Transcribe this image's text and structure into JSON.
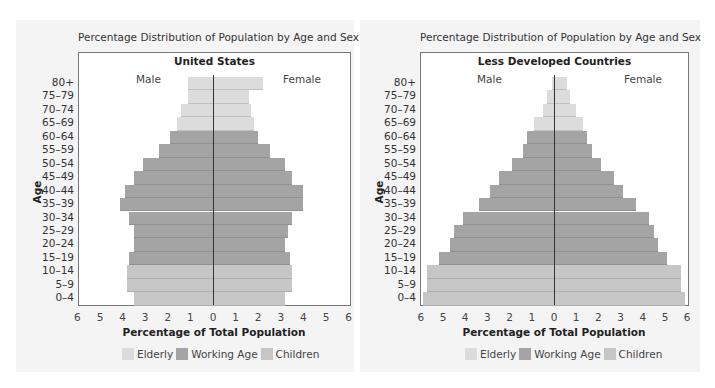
{
  "colors": {
    "elderly": "#dcdcdc",
    "working": "#a4a4a4",
    "children": "#c6c6c6",
    "panel": "#f4f4f4"
  },
  "chart_data": [
    {
      "type": "bar",
      "orientation": "horizontal-population-pyramid",
      "title": "Percentage Distribution of Population by Age and Sex",
      "subtitle": "United States",
      "xlabel": "Percentage of Total Population",
      "ylabel": "Age",
      "left_label": "Male",
      "right_label": "Female",
      "xlim": [
        -6,
        6
      ],
      "x_ticks": [
        "6",
        "5",
        "4",
        "3",
        "2",
        "1",
        "0",
        "1",
        "2",
        "3",
        "4",
        "5",
        "6"
      ],
      "categories": [
        "80+",
        "75–79",
        "70–74",
        "65–69",
        "60–64",
        "55–59",
        "50–54",
        "45–49",
        "40–44",
        "35–39",
        "30–34",
        "25–29",
        "20–24",
        "15–19",
        "10–14",
        "5–9",
        "0–4"
      ],
      "groups": [
        "Elderly",
        "Elderly",
        "Elderly",
        "Elderly",
        "Working Age",
        "Working Age",
        "Working Age",
        "Working Age",
        "Working Age",
        "Working Age",
        "Working Age",
        "Working Age",
        "Working Age",
        "Working Age",
        "Children",
        "Children",
        "Children"
      ],
      "series": [
        {
          "name": "Male",
          "values": [
            1.1,
            1.1,
            1.4,
            1.6,
            1.9,
            2.4,
            3.1,
            3.5,
            3.9,
            4.1,
            3.7,
            3.5,
            3.5,
            3.7,
            3.8,
            3.8,
            3.5
          ]
        },
        {
          "name": "Female",
          "values": [
            2.2,
            1.6,
            1.7,
            1.8,
            2.0,
            2.5,
            3.2,
            3.5,
            4.0,
            4.0,
            3.5,
            3.3,
            3.2,
            3.4,
            3.5,
            3.5,
            3.2
          ]
        }
      ],
      "legend": [
        "Elderly",
        "Working Age",
        "Children"
      ],
      "legend_position": "bottom",
      "grid": false
    },
    {
      "type": "bar",
      "orientation": "horizontal-population-pyramid",
      "title": "Percentage Distribution of Population by Age and Sex",
      "subtitle": "Less Developed Countries",
      "xlabel": "Percentage of Total Population",
      "ylabel": "Age",
      "left_label": "Male",
      "right_label": "Female",
      "xlim": [
        -6,
        6
      ],
      "x_ticks": [
        "6",
        "5",
        "4",
        "3",
        "2",
        "1",
        "0",
        "1",
        "2",
        "3",
        "4",
        "5",
        "6"
      ],
      "categories": [
        "80+",
        "75–79",
        "70–74",
        "65–69",
        "60–64",
        "55–59",
        "50–54",
        "45–49",
        "40–44",
        "35–39",
        "30–34",
        "25–29",
        "20–24",
        "15–19",
        "10–14",
        "5–9",
        "0–4"
      ],
      "groups": [
        "Elderly",
        "Elderly",
        "Elderly",
        "Elderly",
        "Working Age",
        "Working Age",
        "Working Age",
        "Working Age",
        "Working Age",
        "Working Age",
        "Working Age",
        "Working Age",
        "Working Age",
        "Working Age",
        "Children",
        "Children",
        "Children"
      ],
      "series": [
        {
          "name": "Male",
          "values": [
            0.1,
            0.3,
            0.5,
            0.9,
            1.2,
            1.4,
            1.9,
            2.5,
            2.9,
            3.4,
            4.1,
            4.5,
            4.7,
            5.2,
            5.7,
            5.7,
            5.9
          ]
        },
        {
          "name": "Female",
          "values": [
            0.6,
            0.7,
            1.0,
            1.3,
            1.5,
            1.7,
            2.1,
            2.7,
            3.1,
            3.7,
            4.3,
            4.5,
            4.7,
            5.1,
            5.7,
            5.7,
            5.9
          ]
        }
      ],
      "legend": [
        "Elderly",
        "Working Age",
        "Children"
      ],
      "legend_position": "bottom",
      "grid": false
    }
  ]
}
